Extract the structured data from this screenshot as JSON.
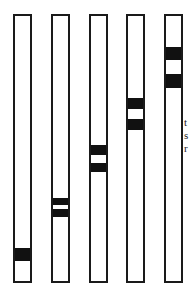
{
  "diagram": {
    "tube_top": 14,
    "tube_bottom": 283,
    "tubes": [
      {
        "label": "tube-1",
        "x": 13,
        "width": 19,
        "bands": [
          {
            "top": 248,
            "bottom": 261
          }
        ]
      },
      {
        "label": "tube-2",
        "x": 51,
        "width": 19,
        "bands": [
          {
            "top": 198,
            "bottom": 205
          },
          {
            "top": 209,
            "bottom": 217
          }
        ]
      },
      {
        "label": "tube-3",
        "x": 89,
        "width": 19,
        "bands": [
          {
            "top": 145,
            "bottom": 155
          },
          {
            "top": 163,
            "bottom": 172
          }
        ]
      },
      {
        "label": "tube-4",
        "x": 126,
        "width": 19,
        "bands": [
          {
            "top": 98,
            "bottom": 109
          },
          {
            "top": 119,
            "bottom": 130
          }
        ]
      },
      {
        "label": "tube-5",
        "x": 164,
        "width": 19,
        "bands": [
          {
            "top": 47,
            "bottom": 60
          },
          {
            "top": 74,
            "bottom": 88
          }
        ]
      }
    ],
    "band_color": "#111111",
    "outline_color": "#1a1a1a"
  },
  "text_fragments": [
    "t",
    "s",
    "r"
  ]
}
